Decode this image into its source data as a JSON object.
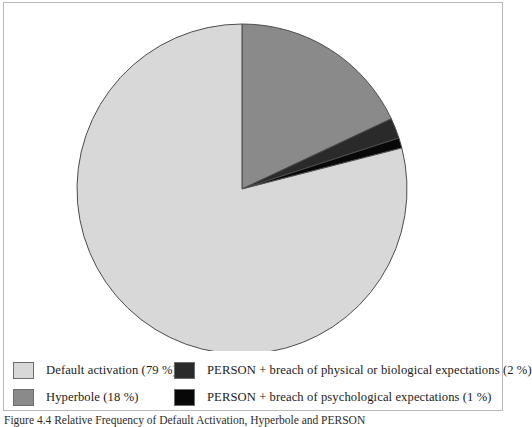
{
  "figure": {
    "caption": "Figure 4.4 Relative Frequency of Default Activation, Hyperbole and PERSON"
  },
  "colors": {
    "default_activation": "#d8d8d8",
    "hyperbole": "#8a8a8a",
    "person_physical": "#2a2a2a",
    "person_psychological": "#080808",
    "outline": "#4d4d4d",
    "frame": "#b9b9b9"
  },
  "legend": {
    "rows": [
      {
        "left": {
          "label": "Default activation (79 %)",
          "swatch": "#d8d8d8"
        },
        "right": {
          "label": "PERSON + breach of physical or biological expectations (2 %)",
          "swatch": "#2a2a2a"
        }
      },
      {
        "left": {
          "label": "Hyperbole (18 %)",
          "swatch": "#8a8a8a"
        },
        "right": {
          "label": "PERSON + breach of psychological expectations (1 %)",
          "swatch": "#080808"
        }
      }
    ]
  },
  "chart_data": {
    "type": "pie",
    "title": "",
    "subtitle": "",
    "xlabel": "",
    "ylabel": "",
    "start_angle": 0,
    "direction": "clockwise",
    "legend_position": "bottom",
    "grid": false,
    "unit": "%",
    "categories": [
      "Hyperbole",
      "PERSON + breach of physical or biological expectations",
      "PERSON + breach of psychological expectations",
      "Default activation"
    ],
    "values": [
      18,
      2,
      1,
      79
    ],
    "slices": [
      {
        "label": "Hyperbole",
        "value": 18,
        "display": "18 %",
        "color": "#8a8a8a",
        "start_deg": 0,
        "end_deg": 64.8
      },
      {
        "label": "PERSON + breach of physical or biological expectations",
        "value": 2,
        "display": "2 %",
        "color": "#2a2a2a",
        "start_deg": 64.8,
        "end_deg": 72.0
      },
      {
        "label": "PERSON + breach of psychological expectations",
        "value": 1,
        "display": "1 %",
        "color": "#080808",
        "start_deg": 72.0,
        "end_deg": 75.6
      },
      {
        "label": "Default activation",
        "value": 79,
        "display": "79 %",
        "color": "#d8d8d8",
        "start_deg": 75.6,
        "end_deg": 360.0
      }
    ],
    "geometry": {
      "center_x": 238,
      "center_y": 186,
      "radius": 165
    }
  }
}
